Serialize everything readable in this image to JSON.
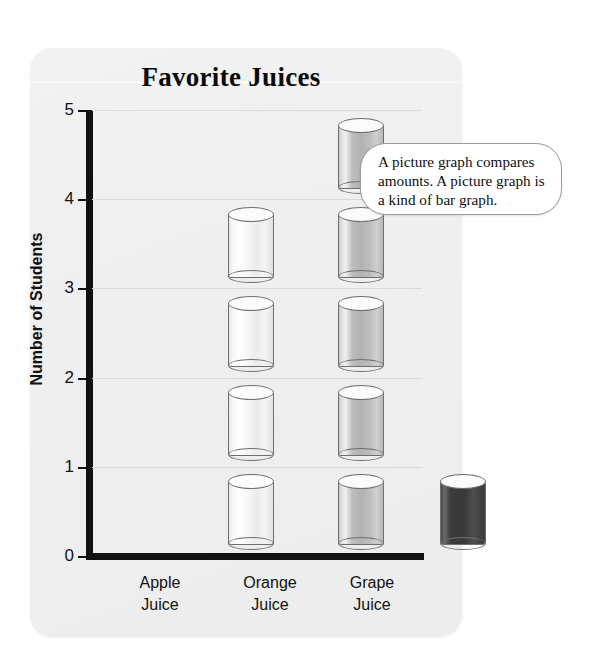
{
  "chart_data": {
    "type": "bar",
    "title": "Favorite Juices",
    "xlabel": "",
    "ylabel": "Number of Students",
    "categories": [
      "Apple Juice",
      "Orange Juice",
      "Grape Juice"
    ],
    "category_lines": [
      [
        "Apple",
        "Juice"
      ],
      [
        "Orange",
        "Juice"
      ],
      [
        "Grape",
        "Juice"
      ]
    ],
    "values": [
      4,
      5,
      1
    ],
    "ylim": [
      0,
      5
    ],
    "yticks": [
      0,
      1,
      2,
      3,
      4,
      5
    ],
    "ytick_labels": [
      "0",
      "1",
      "2",
      "3",
      "4",
      "5"
    ],
    "grid": true,
    "legend": "none",
    "icon_unit": "glass-of-juice",
    "icon_unit_value": 1,
    "series_colors": [
      "#f2f2f2",
      "#b9b9b9",
      "#3d3d3d"
    ]
  },
  "callout": {
    "text": "A picture graph compares amounts. A picture graph is a kind of bar graph."
  }
}
